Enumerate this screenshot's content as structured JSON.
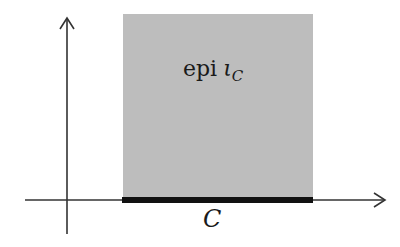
{
  "diagram": {
    "region_label": {
      "prefix": "epi",
      "symbol": "ι",
      "subscript": "C"
    },
    "set_label": "C",
    "colors": {
      "region_fill": "#bdbdbd",
      "axis": "#333333",
      "set_bar": "#111111"
    },
    "axes": {
      "x_axis": "horizontal arrow",
      "y_axis": "vertical arrow"
    }
  }
}
